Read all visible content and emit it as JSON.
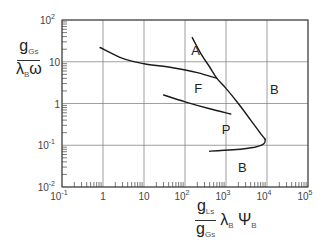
{
  "chart_data": {
    "type": "line",
    "title": "",
    "scale": {
      "x": "log",
      "y": "log"
    },
    "xlim": [
      0.1,
      100000
    ],
    "ylim": [
      0.01,
      100
    ],
    "grid": true,
    "xticks": [
      {
        "value": 0.1,
        "base": "10",
        "exp": "-1"
      },
      {
        "value": 1,
        "base": "1",
        "exp": ""
      },
      {
        "value": 10,
        "base": "10",
        "exp": ""
      },
      {
        "value": 100,
        "base": "10",
        "exp": "2"
      },
      {
        "value": 1000,
        "base": "10",
        "exp": "3"
      },
      {
        "value": 10000,
        "base": "10",
        "exp": "4"
      },
      {
        "value": 100000,
        "base": "10",
        "exp": "5"
      }
    ],
    "yticks": [
      {
        "value": 100,
        "base": "10",
        "exp": "2"
      },
      {
        "value": 10,
        "base": "10",
        "exp": ""
      },
      {
        "value": 1,
        "base": "1",
        "exp": ""
      },
      {
        "value": 0.1,
        "base": "10",
        "exp": "-1"
      },
      {
        "value": 0.01,
        "base": "10",
        "exp": "-2"
      }
    ],
    "xlabel": {
      "num": "g",
      "num_sub": "Ls",
      "den": "g",
      "den_sub": "Gs",
      "tail_1": "λ",
      "tail_1_sub": "B",
      "tail_2": "Ψ",
      "tail_2_sub": "B"
    },
    "ylabel": {
      "num": "g",
      "num_sub": "Gs",
      "den": "λ",
      "den_sub": "B",
      "den_tail": "ω"
    },
    "series": [
      {
        "name": "A-F boundary",
        "points": [
          [
            0.85,
            22
          ],
          [
            3,
            12
          ],
          [
            10,
            9
          ],
          [
            50,
            7.2
          ],
          [
            200,
            5.5
          ],
          [
            600,
            4.0
          ]
        ]
      },
      {
        "name": "A-B boundary",
        "points": [
          [
            150,
            38
          ],
          [
            250,
            15
          ],
          [
            400,
            7.5
          ],
          [
            600,
            4.0
          ],
          [
            1000,
            2.3
          ],
          [
            2000,
            1.0
          ],
          [
            4000,
            0.4
          ],
          [
            7000,
            0.19
          ],
          [
            9000,
            0.14
          ]
        ]
      },
      {
        "name": "F-P boundary",
        "points": [
          [
            30,
            1.6
          ],
          [
            100,
            1.1
          ],
          [
            400,
            0.75
          ],
          [
            1300,
            0.56
          ]
        ]
      },
      {
        "name": "P-B boundary",
        "points": [
          [
            9000,
            0.14
          ],
          [
            8500,
            0.11
          ],
          [
            5000,
            0.09
          ],
          [
            1500,
            0.078
          ],
          [
            400,
            0.072
          ]
        ]
      }
    ],
    "annotations": [
      {
        "text": "A",
        "x": 180,
        "y": 18
      },
      {
        "text": "F",
        "x": 210,
        "y": 2.2
      },
      {
        "text": "B",
        "x": 15000,
        "y": 2.0
      },
      {
        "text": "P",
        "x": 1000,
        "y": 0.22
      },
      {
        "text": "B",
        "x": 2500,
        "y": 0.028
      }
    ]
  },
  "plot_area": {
    "left": 62,
    "top": 20,
    "right": 308,
    "bottom": 187
  }
}
